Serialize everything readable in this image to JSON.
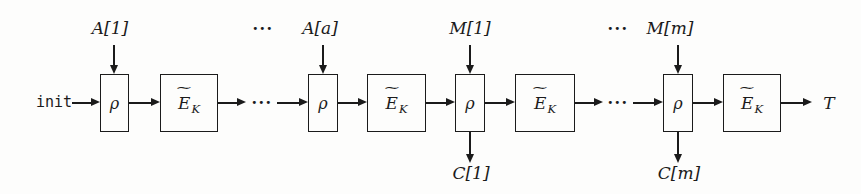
{
  "colors": {
    "background": "#fdfdfc",
    "line": "#1b1b1b"
  },
  "diagram": {
    "init": "init",
    "rho": "ρ",
    "ek": {
      "tilde": "∼",
      "base": "E",
      "sub": "K"
    },
    "inputs": {
      "a1": "A[1]",
      "aa": "A[a]",
      "m1": "M[1]",
      "mm": "M[m]"
    },
    "outputs": {
      "c1": "C[1]",
      "cm": "C[m]",
      "tag": "T"
    },
    "ellipsis": "···"
  }
}
